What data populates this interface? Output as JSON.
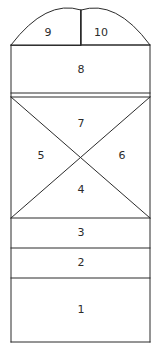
{
  "figure": {
    "title": "",
    "background_color": "#ffffff",
    "line_color": "#2b2b2b",
    "fill_color": "#ffffff",
    "line_width": 1
  },
  "geometry": {
    "left": 11,
    "right": 150,
    "body_top": 45,
    "arch_apex_y": 10,
    "arch_center_x": 81,
    "bottom": 342,
    "divider_y": [
      45,
      93,
      97,
      218,
      248,
      278,
      342
    ],
    "x_cross_center": {
      "x": 81,
      "y": 157
    }
  },
  "regions": [
    {
      "id": "region-1",
      "label": "1",
      "label_x": 81,
      "label_y": 310,
      "shape": "rectangle",
      "top": 278,
      "bottom": 342
    },
    {
      "id": "region-2",
      "label": "2",
      "label_x": 81,
      "label_y": 263,
      "shape": "rectangle",
      "top": 248,
      "bottom": 278
    },
    {
      "id": "region-3",
      "label": "3",
      "label_x": 81,
      "label_y": 233,
      "shape": "rectangle",
      "top": 218,
      "bottom": 248
    },
    {
      "id": "region-4",
      "label": "4",
      "label_x": 81,
      "label_y": 190,
      "shape": "triangle-down"
    },
    {
      "id": "region-5",
      "label": "5",
      "label_x": 41,
      "label_y": 156,
      "shape": "triangle-left"
    },
    {
      "id": "region-6",
      "label": "6",
      "label_x": 122,
      "label_y": 156,
      "shape": "triangle-right"
    },
    {
      "id": "region-7",
      "label": "7",
      "label_x": 81,
      "label_y": 124,
      "shape": "triangle-up"
    },
    {
      "id": "region-8",
      "label": "8",
      "label_x": 81,
      "label_y": 70,
      "shape": "rectangle",
      "top": 45,
      "bottom": 93
    },
    {
      "id": "region-9",
      "label": "9",
      "label_x": 48,
      "label_y": 33,
      "shape": "arch-left"
    },
    {
      "id": "region-10",
      "label": "10",
      "label_x": 101,
      "label_y": 33,
      "shape": "arch-right"
    }
  ]
}
